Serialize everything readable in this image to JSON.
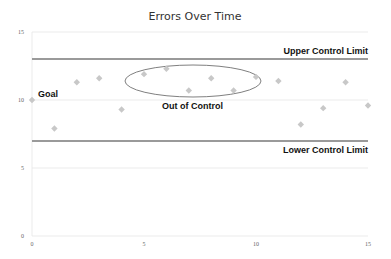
{
  "chart_data": {
    "type": "scatter",
    "title": "Errors Over Time",
    "xlabel": "",
    "ylabel": "",
    "xlim": [
      0,
      15
    ],
    "ylim": [
      0,
      15
    ],
    "xticks": [
      0,
      5,
      10,
      15
    ],
    "yticks": [
      0,
      5,
      10,
      15
    ],
    "grid": true,
    "legend": "none",
    "series": [
      {
        "name": "Errors",
        "x": [
          0,
          1,
          2,
          3,
          4,
          5,
          6,
          7,
          8,
          9,
          10,
          11,
          12,
          13,
          14,
          15
        ],
        "values": [
          10,
          7.9,
          11.3,
          11.6,
          9.3,
          11.9,
          12.3,
          10.7,
          11.6,
          10.7,
          11.7,
          11.4,
          8.2,
          9.4,
          11.3,
          9.6
        ]
      }
    ],
    "reference_lines": [
      {
        "name": "Upper Control Limit",
        "y": 13
      },
      {
        "name": "Lower Control Limit",
        "y": 7
      }
    ],
    "annotations": [
      {
        "text": "Goal",
        "x": 0,
        "y": 10
      },
      {
        "text": "Out of Control",
        "x": 8,
        "y": 10.5,
        "note": "ellipse around points x=5..11"
      },
      {
        "text": "Upper Control Limit",
        "x": 13,
        "y": 13
      },
      {
        "text": "Lower Control Limit",
        "x": 13,
        "y": 7
      }
    ]
  },
  "labels": {
    "title": "Errors Over Time",
    "goal": "Goal",
    "out_of_control": "Out of Control",
    "ucl": "Upper Control Limit",
    "lcl": "Lower Control Limit",
    "y_ticks": [
      "15",
      "10",
      "5",
      "0"
    ],
    "x_ticks": [
      "0",
      "5",
      "10",
      "15"
    ]
  },
  "colors": {
    "marker": "#c8c8c8",
    "control_line": "#9a9a9a",
    "grid": "#e6e6e6",
    "ellipse": "#7f7f7f"
  }
}
